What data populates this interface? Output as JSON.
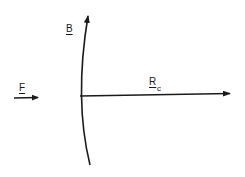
{
  "diagram": {
    "type": "vector-diagram",
    "labels": {
      "boundary": "B",
      "force": "F",
      "radius_main": "R",
      "radius_sub": "c"
    },
    "elements": [
      {
        "id": "boundary-arc",
        "label": "B",
        "direction": "up",
        "shape": "curved arc"
      },
      {
        "id": "force-arrow",
        "label": "F",
        "direction": "right"
      },
      {
        "id": "radius-arrow",
        "label": "R_c",
        "direction": "right",
        "origin": "boundary-arc"
      }
    ],
    "colors": {
      "stroke": "#1a1a1a",
      "background": "#ffffff"
    }
  }
}
